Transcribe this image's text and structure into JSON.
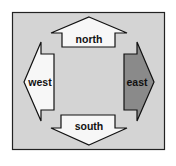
{
  "diagram": {
    "frame": {
      "fill": "#d4d4d4",
      "stroke": "#222222"
    },
    "arrows": [
      {
        "label": "north",
        "direction": "up",
        "fill": "#f7f7f7"
      },
      {
        "label": "west",
        "direction": "left",
        "fill": "#f7f7f7"
      },
      {
        "label": "east",
        "direction": "right",
        "fill": "#8a8a8a"
      },
      {
        "label": "south",
        "direction": "down",
        "fill": "#f7f7f7"
      }
    ]
  }
}
